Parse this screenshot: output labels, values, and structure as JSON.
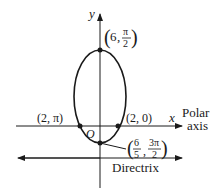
{
  "diagram": {
    "axes": {
      "y_label": "y",
      "x_label": "x",
      "polar_axis_label_line1": "Polar",
      "polar_axis_label_line2": "axis",
      "origin_label": "O"
    },
    "points": {
      "top": {
        "label_r": "6",
        "label_num": "π",
        "label_den": "2"
      },
      "left": {
        "label": "(2, π)"
      },
      "right": {
        "label": "(2, 0)"
      },
      "bottom": {
        "num1": "6",
        "den1": "5",
        "num2": "3π",
        "den2": "2"
      }
    },
    "directrix_label": "Directrix",
    "colors": {
      "stroke": "#1a1a1a",
      "background": "#ffffff"
    }
  }
}
